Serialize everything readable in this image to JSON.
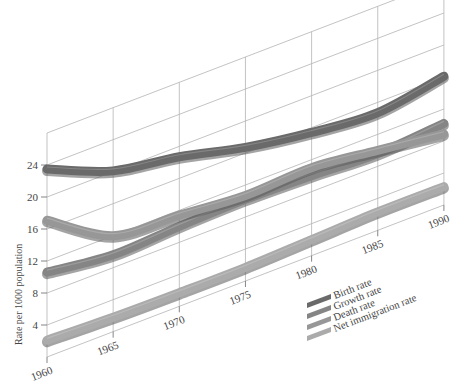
{
  "chart_data": {
    "type": "line",
    "title": "",
    "xlabel": "",
    "ylabel": "Rate per 1000 population",
    "x": [
      1960,
      1965,
      1970,
      1975,
      1980,
      1985,
      1990
    ],
    "x_ticks": [
      "1960",
      "1965",
      "1970",
      "1975",
      "1980",
      "1985",
      "1990"
    ],
    "y_ticks": [
      "4",
      "8",
      "12",
      "16",
      "20",
      "24"
    ],
    "ylim": [
      0,
      28
    ],
    "grid": true,
    "projection": "oblique 3D ribbon",
    "legend_position": "lower right",
    "series": [
      {
        "name": "Birth rate",
        "color": "#6a6a6a",
        "values": [
          23.5,
          20.1,
          18.7,
          16.7,
          15.4,
          14.7,
          16.1
        ]
      },
      {
        "name": "Growth rate",
        "color": "#858585",
        "values": [
          10.6,
          9.6,
          10.0,
          10.2,
          10.0,
          9.6,
          10.2
        ]
      },
      {
        "name": "Death rate",
        "color": "#979797",
        "values": [
          17.1,
          12.0,
          11.4,
          10.7,
          11.0,
          10.0,
          8.9
        ]
      },
      {
        "name": "Net immigration rate",
        "color": "#ababab",
        "values": [
          2.1,
          1.8,
          1.7,
          1.7,
          2.0,
          2.3,
          2.3
        ]
      }
    ]
  },
  "legend": {
    "items": [
      "Birth rate",
      "Growth rate",
      "Death rate",
      "Net immigration rate"
    ]
  }
}
